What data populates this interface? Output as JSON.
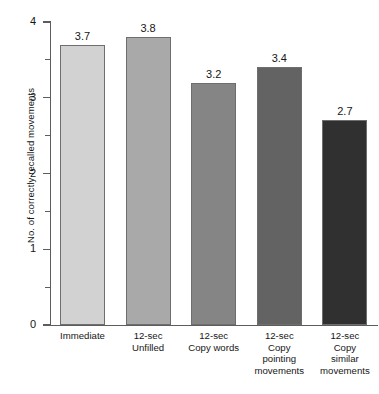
{
  "chart_data": {
    "type": "bar",
    "title": "",
    "xlabel": "",
    "ylabel": "No. of correctly recalled movements",
    "ylim": [
      0,
      4
    ],
    "grid": false,
    "legend": "none",
    "y_major_ticks": [
      "0",
      "1",
      "2",
      "3",
      "4"
    ],
    "y_minor_tick_values": [
      0.5,
      1.5,
      2.5,
      3.5
    ],
    "categories": [
      "Immediate",
      "12-sec Unfilled",
      "12-sec Copy words",
      "12-sec Copy pointing movements",
      "12-sec Copy similar movements"
    ],
    "category_lines": [
      [
        "Immediate"
      ],
      [
        "12-sec",
        "Unfilled"
      ],
      [
        "12-sec",
        "Copy words"
      ],
      [
        "12-sec",
        "Copy",
        "pointing",
        "movements"
      ],
      [
        "12-sec",
        "Copy",
        "similar",
        "movements"
      ]
    ],
    "values": [
      3.7,
      3.8,
      3.2,
      3.4,
      2.7
    ],
    "value_labels": [
      "3.7",
      "3.8",
      "3.2",
      "3.4",
      "2.7"
    ],
    "bar_colors": [
      "#d2d2d2",
      "#a9a9a9",
      "#858585",
      "#636363",
      "#303030"
    ]
  },
  "axis_colors": {
    "axis_line": "#5d5d5d",
    "bar_outline": "#6e6e6e",
    "text": "#161616"
  }
}
